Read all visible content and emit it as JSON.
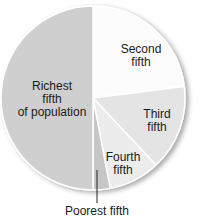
{
  "chart_data": {
    "type": "pie",
    "title": "",
    "categories": [
      "Richest fifth of population",
      "Second fifth",
      "Third fifth",
      "Fourth fifth",
      "Poorest fifth"
    ],
    "values": [
      50,
      23,
      15,
      9,
      3
    ],
    "unit": "percent (estimated from slice angles)",
    "colors": [
      "#cfcfcf",
      "#fcfcfc",
      "#e4e4e4",
      "#ececec",
      "#c6c6c6"
    ],
    "start_angle_deg": 0,
    "direction": "clockwise, Second fifth starting at top",
    "legend": "none (labels inside slices; Poorest fifth via leader line)"
  },
  "labels": {
    "richest": [
      "Richest",
      "fifth",
      "of population"
    ],
    "second": [
      "Second",
      "fifth"
    ],
    "third": [
      "Third",
      "fifth"
    ],
    "fourth": [
      "Fourth",
      "fifth"
    ],
    "poorest": "Poorest fifth"
  }
}
